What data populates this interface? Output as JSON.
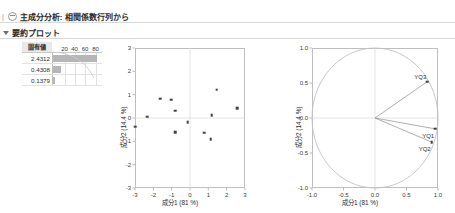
{
  "header": {
    "main_title": "主成分分析: 相関係数行列から",
    "sub_title": "要約プロット",
    "main_disc_icon": "outline-disclosure-icon",
    "sub_triangle_icon": "outline-triangle-icon"
  },
  "eigen_table": {
    "column_header": "固有値",
    "axis_ticks": [
      "20",
      "40",
      "60",
      "80"
    ],
    "rows": [
      {
        "value": "2.4312",
        "percent": 81.0
      },
      {
        "value": "0.4308",
        "percent": 14.4
      },
      {
        "value": "0.1379",
        "percent": 4.6
      }
    ]
  },
  "chart_data": [
    {
      "type": "scatter",
      "name": "score-plot",
      "title": "",
      "xlabel": "成分1 (81 %)",
      "ylabel": "成分2 (14.4 %)",
      "xlim": [
        -3,
        3
      ],
      "ylim": [
        -3,
        3
      ],
      "xticks": [
        "-3",
        "-2",
        "-1",
        "0",
        "1",
        "2",
        "3"
      ],
      "yticks": [
        "3",
        "2",
        "1",
        "0",
        "-1",
        "-2",
        "-3"
      ],
      "grid": true,
      "points": [
        {
          "x": -2.98,
          "y": -0.38
        },
        {
          "x": -2.32,
          "y": 0.05
        },
        {
          "x": -1.62,
          "y": 0.82
        },
        {
          "x": -1.02,
          "y": 0.79
        },
        {
          "x": -0.82,
          "y": 0.31
        },
        {
          "x": -0.82,
          "y": -0.6
        },
        {
          "x": -0.12,
          "y": -0.18
        },
        {
          "x": 0.78,
          "y": -0.63
        },
        {
          "x": 1.12,
          "y": -0.92
        },
        {
          "x": 1.18,
          "y": 0.13
        },
        {
          "x": 1.45,
          "y": 1.21
        },
        {
          "x": 2.58,
          "y": 0.42
        }
      ]
    },
    {
      "type": "scatter",
      "name": "loading-plot",
      "title": "",
      "xlabel": "成分1 (81 %)",
      "ylabel": "成分2 (14.4 %)",
      "xlim": [
        -1.0,
        1.0
      ],
      "ylim": [
        -1.0,
        1.0
      ],
      "xticks": [
        "-1.0",
        "-0.5",
        "0.0",
        "0.5",
        "1.0"
      ],
      "yticks": [
        "1.0",
        "0.5",
        "0.0",
        "-0.5",
        "-1.0"
      ],
      "grid": true,
      "unit_circle": true,
      "vectors": [
        {
          "label": "YQ3",
          "x": 0.83,
          "y": 0.52
        },
        {
          "label": "YQ1",
          "x": 0.955,
          "y": -0.155
        },
        {
          "label": "YQ2",
          "x": 0.9,
          "y": -0.345
        }
      ]
    }
  ],
  "colors": {
    "frame": "#bfbfbf",
    "grid": "#dcdcdc",
    "point": "#404040",
    "bar": "#b6b6b6",
    "vector": "#9a9a9a",
    "circle": "#c2c2c2",
    "text": "#2b2b2b"
  }
}
